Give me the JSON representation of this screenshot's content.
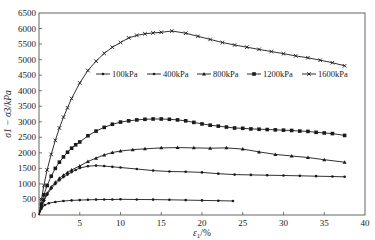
{
  "chart_data": {
    "type": "line",
    "title": "",
    "xlabel": "ε1/%",
    "ylabel": "σ1−σ3/kPa",
    "xlim": [
      0,
      40
    ],
    "ylim": [
      0,
      6500
    ],
    "xticks": [
      0,
      5,
      10,
      15,
      20,
      25,
      30,
      35,
      40
    ],
    "xtick_labels": [
      "",
      "5",
      "10",
      "15",
      "20",
      "25",
      "30",
      "35",
      "40"
    ],
    "yticks": [
      0,
      500,
      1000,
      1500,
      2000,
      2500,
      3000,
      3500,
      4000,
      4500,
      5000,
      5500,
      6000,
      6500
    ],
    "ytick_labels": [
      "0",
      "500",
      "1000",
      "1500",
      "2000",
      "2500",
      "3000",
      "3500",
      "4000",
      "4500",
      "5000",
      "5500",
      "6000",
      "6500"
    ],
    "grid": false,
    "legend_position": "inside-upper-middle",
    "line_color": "#1a1a1a",
    "series": [
      {
        "name": "100kPa",
        "marker": "dot",
        "x": [
          0,
          0.3,
          0.7,
          1.2,
          2,
          3,
          4,
          5,
          6,
          7,
          8,
          9,
          10,
          12,
          14,
          16,
          18,
          20,
          22,
          23.8
        ],
        "y": [
          0,
          200,
          320,
          380,
          420,
          450,
          470,
          480,
          490,
          495,
          500,
          500,
          505,
          500,
          495,
          490,
          480,
          470,
          460,
          450
        ]
      },
      {
        "name": "400kPa",
        "marker": "dot",
        "x": [
          0,
          0.3,
          0.6,
          1,
          1.5,
          2,
          2.5,
          3,
          3.5,
          4,
          4.5,
          5,
          6,
          7,
          8,
          9,
          10,
          12,
          14,
          16,
          18,
          20,
          22,
          24,
          26,
          28,
          30,
          32,
          34,
          36,
          37.5
        ],
        "y": [
          0,
          250,
          450,
          650,
          850,
          1000,
          1120,
          1220,
          1300,
          1380,
          1450,
          1510,
          1570,
          1590,
          1575,
          1550,
          1530,
          1480,
          1430,
          1400,
          1390,
          1370,
          1330,
          1300,
          1290,
          1280,
          1270,
          1260,
          1250,
          1240,
          1230
        ]
      },
      {
        "name": "800kPa",
        "marker": "triangle",
        "x": [
          0,
          0.3,
          0.6,
          1,
          1.5,
          2,
          2.5,
          3,
          3.5,
          4,
          5,
          6,
          7,
          8,
          9,
          10,
          11.5,
          13,
          15,
          17,
          19,
          21,
          23,
          25,
          27,
          29,
          31,
          33,
          35,
          37.5
        ],
        "y": [
          0,
          280,
          500,
          700,
          900,
          1050,
          1180,
          1280,
          1370,
          1450,
          1580,
          1720,
          1830,
          1930,
          2010,
          2060,
          2100,
          2130,
          2160,
          2170,
          2160,
          2150,
          2160,
          2120,
          2030,
          1950,
          1900,
          1850,
          1780,
          1700
        ]
      },
      {
        "name": "1200kPa",
        "marker": "square",
        "x": [
          0,
          0.3,
          0.6,
          1,
          1.5,
          2,
          2.5,
          3,
          3.5,
          4,
          4.5,
          5,
          6,
          7,
          8,
          9,
          10,
          11,
          12,
          13,
          14,
          15,
          16,
          17,
          18,
          19,
          20,
          21,
          22,
          23,
          24,
          25,
          26,
          27,
          28,
          29,
          30,
          31,
          32,
          33,
          34,
          35,
          36,
          37.5
        ],
        "y": [
          0,
          350,
          650,
          950,
          1250,
          1500,
          1700,
          1870,
          2020,
          2150,
          2260,
          2350,
          2550,
          2700,
          2820,
          2920,
          2990,
          3030,
          3060,
          3080,
          3090,
          3090,
          3080,
          3060,
          3030,
          2980,
          2930,
          2890,
          2860,
          2830,
          2800,
          2790,
          2770,
          2760,
          2750,
          2740,
          2730,
          2720,
          2700,
          2690,
          2660,
          2640,
          2620,
          2560
        ]
      },
      {
        "name": "1600kPa",
        "marker": "x",
        "x": [
          0,
          0.3,
          0.6,
          1,
          1.5,
          2,
          2.5,
          3,
          3.5,
          4,
          5,
          6,
          7,
          8,
          9,
          10,
          11,
          12,
          13,
          14,
          15,
          16.3,
          18,
          19.5,
          21,
          22.5,
          24,
          25.5,
          27,
          28.5,
          30,
          31.5,
          33,
          34.5,
          36,
          37.5
        ],
        "y": [
          0,
          500,
          950,
          1450,
          1950,
          2400,
          2800,
          3150,
          3450,
          3750,
          4250,
          4650,
          4950,
          5200,
          5400,
          5550,
          5700,
          5780,
          5830,
          5860,
          5880,
          5920,
          5850,
          5750,
          5650,
          5550,
          5470,
          5400,
          5330,
          5260,
          5190,
          5120,
          5060,
          4980,
          4900,
          4800
        ]
      }
    ]
  },
  "legend": {
    "items": [
      "100kPa",
      "400kPa",
      "800kPa",
      "1200kPa",
      "1600kPa"
    ]
  },
  "axes": {
    "xlabel_main": "ε",
    "xlabel_sub": "1",
    "xlabel_unit": "/%",
    "ylabel_text": "σ1 − σ3/kPa"
  }
}
